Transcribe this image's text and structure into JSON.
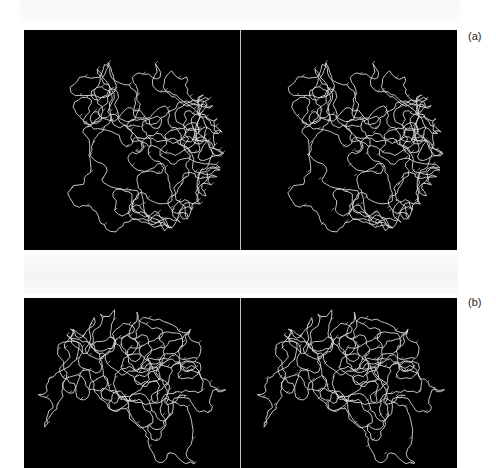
{
  "figure": {
    "panels": [
      {
        "id": "a",
        "label": "(a)",
        "description": "Stereo pair of protein C-alpha backbone trace",
        "views": [
          "left-eye",
          "right-eye"
        ],
        "background_color": "#000000",
        "trace_color": "#d8d8d8"
      },
      {
        "id": "b",
        "label": "(b)",
        "description": "Stereo pair of protein C-alpha backbone trace",
        "views": [
          "left-eye",
          "right-eye"
        ],
        "background_color": "#000000",
        "trace_color": "#d8d8d8"
      }
    ],
    "divider_color": "#bdbdbd"
  }
}
